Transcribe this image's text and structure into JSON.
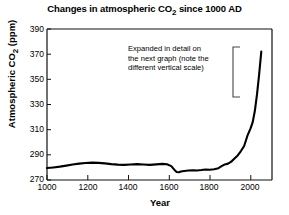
{
  "chart_data": {
    "type": "line",
    "title": "Changes in atmospheric CO2 since 1000 AD",
    "title_html": "Changes in atmospheric CO₂ since 1000 AD",
    "xlabel": "Year",
    "ylabel": "Atmospheric CO2 (ppm)",
    "ylabel_html": "Atmospheric CO₂ (ppm)",
    "xlim": [
      1000,
      2050
    ],
    "ylim": [
      270,
      390
    ],
    "xticks": [
      1000,
      1200,
      1400,
      1600,
      1800,
      2000
    ],
    "yticks": [
      270,
      290,
      310,
      330,
      350,
      370,
      390
    ],
    "grid": false,
    "legend": false,
    "line_color": "#000000",
    "series": [
      {
        "name": "Atmospheric CO2",
        "x": [
          1000,
          1030,
          1060,
          1090,
          1120,
          1150,
          1180,
          1210,
          1240,
          1270,
          1300,
          1330,
          1360,
          1390,
          1420,
          1450,
          1480,
          1510,
          1540,
          1560,
          1580,
          1595,
          1605,
          1615,
          1625,
          1640,
          1660,
          1680,
          1700,
          1720,
          1740,
          1760,
          1780,
          1800,
          1815,
          1830,
          1845,
          1860,
          1875,
          1890,
          1905,
          1920,
          1935,
          1950,
          1960,
          1970,
          1980,
          1990,
          2000
        ],
        "y": [
          279.5,
          280.0,
          280.6,
          281.4,
          282.3,
          283.0,
          283.5,
          283.8,
          283.6,
          283.2,
          282.6,
          282.2,
          282.0,
          282.3,
          282.6,
          282.3,
          282.0,
          282.4,
          282.8,
          282.5,
          281.0,
          278.0,
          276.4,
          276.2,
          276.8,
          277.2,
          277.6,
          277.8,
          277.6,
          277.9,
          278.4,
          278.2,
          278.6,
          279.4,
          281.0,
          282.4,
          283.0,
          284.6,
          287.0,
          289.5,
          293.0,
          297.0,
          305.0,
          311.0,
          316.0,
          325.0,
          338.0,
          354.0,
          372.0
        ]
      }
    ],
    "annotation": {
      "text_lines": [
        "Expanded in detail on",
        "the next graph (note the",
        "different vertical scale)"
      ],
      "bracket": "left-square-bracket",
      "points_to": "industrial-rise-segment"
    }
  }
}
